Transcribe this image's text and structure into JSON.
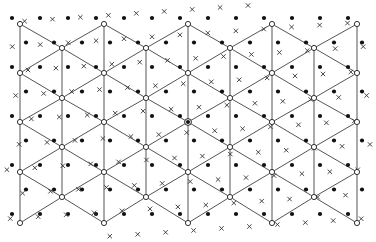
{
  "figure": {
    "width": 376,
    "height": 242,
    "colors": {
      "background": "#ffffff",
      "edge": "#555555",
      "vertex_stroke": "#333333",
      "dot": "#111111",
      "cross": "#333333"
    },
    "triangular_lattice": {
      "columns_x": [
        20,
        62,
        104,
        146,
        188,
        230,
        272,
        314,
        357
      ],
      "even_column_vertex_y": [
        24,
        73,
        122,
        172,
        223
      ],
      "odd_column_vertex_y": [
        48,
        98,
        147,
        197
      ],
      "vertex_marker": "open-circle",
      "center_vertex": {
        "x": 188,
        "y": 122,
        "marker": "filled-in-open-circle"
      }
    },
    "dot_lattice": {
      "description": "filled dots, superlattice",
      "origin": {
        "x": 12,
        "y": 18
      },
      "spacing_x": 28,
      "spacing_y": 24.5,
      "row_offset_x": 14,
      "rows": 10,
      "cols": 14,
      "radius": 2.1
    },
    "cross_lattice": {
      "description": "crosses, rotated superlattice",
      "origin": {
        "x": 32,
        "y": 10
      },
      "spacing_x": 28,
      "spacing_y": 24.5,
      "row_offset_x": 14,
      "rotation_deg": -4,
      "center": {
        "x": 188,
        "y": 122
      },
      "rows": 10,
      "cols": 14,
      "size": 2.2
    },
    "legend": []
  }
}
